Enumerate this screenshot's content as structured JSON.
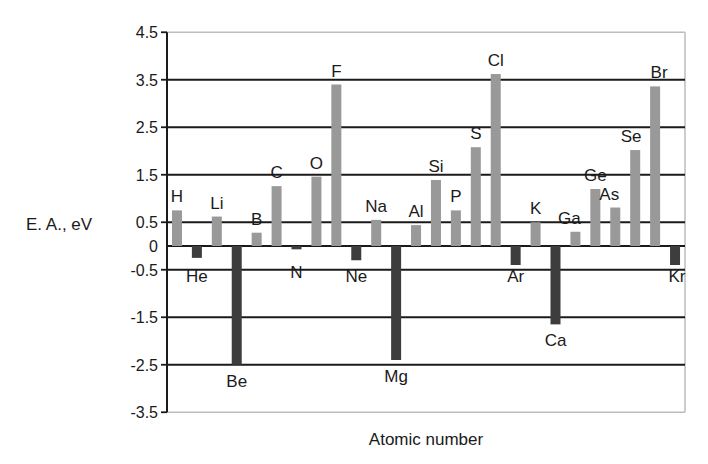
{
  "chart_data": {
    "type": "bar",
    "title": "",
    "xlabel": "Atomic number",
    "ylabel": "E. A., eV",
    "ylim": [
      -3.5,
      4.5
    ],
    "yticks": [
      4.5,
      3.5,
      2.5,
      1.5,
      0.5,
      0,
      -0.5,
      -1.5,
      -2.5,
      -3.5
    ],
    "ytick_labels": [
      "4.5",
      "3.5",
      "2.5",
      "1.5",
      "0.5",
      "0",
      "-0.5",
      "-1.5",
      "-2.5",
      "-3.5"
    ],
    "grid": true,
    "legend": null,
    "colors": {
      "positive": "#999999",
      "negative": "#3d3d3d",
      "grid": "#1a1a1a",
      "frame": "#bdbdbd"
    },
    "categories": [
      "H",
      "He",
      "Li",
      "Be",
      "B",
      "C",
      "N",
      "O",
      "F",
      "Ne",
      "Na",
      "Mg",
      "Al",
      "Si",
      "P",
      "S",
      "Cl",
      "Ar",
      "K",
      "Ca",
      "Ga",
      "Ge",
      "As",
      "Se",
      "Br",
      "Kr"
    ],
    "values": [
      0.75,
      -0.25,
      0.62,
      -2.5,
      0.28,
      1.26,
      -0.07,
      1.46,
      3.4,
      -0.3,
      0.55,
      -2.4,
      0.44,
      1.39,
      0.75,
      2.08,
      3.62,
      -0.4,
      0.5,
      -1.65,
      0.3,
      1.2,
      0.81,
      2.02,
      3.36,
      -0.4
    ]
  }
}
